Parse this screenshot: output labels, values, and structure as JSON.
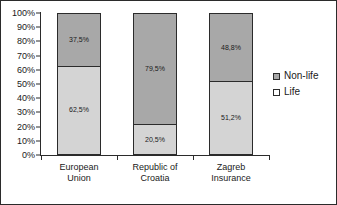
{
  "chart_data": {
    "type": "bar",
    "subtype": "100-percent-stacked-column",
    "title": "",
    "subtitle": "",
    "xlabel": "",
    "ylabel": "",
    "categories": [
      "European Union",
      "Republic of Croatia",
      "Zagreb Insurance"
    ],
    "category_lines": [
      [
        "European",
        "Union"
      ],
      [
        "Republic of",
        "Croatia"
      ],
      [
        "Zagreb",
        "Insurance"
      ]
    ],
    "series": [
      {
        "name": "Non-life",
        "color": "#a8a8a8",
        "values": [
          37.5,
          79.5,
          48.8
        ],
        "labels": [
          "37,5%",
          "79,5%",
          "48,8%"
        ]
      },
      {
        "name": "Life",
        "color": "#d4d4d4",
        "values": [
          62.5,
          20.5,
          51.2
        ],
        "labels": [
          "62,5%",
          "20,5%",
          "51,2%"
        ]
      }
    ],
    "ylim": [
      0,
      100
    ],
    "ytick_values": [
      0,
      10,
      20,
      30,
      40,
      50,
      60,
      70,
      80,
      90,
      100
    ],
    "ytick_labels": [
      "0%",
      "10%",
      "20%",
      "30%",
      "40%",
      "50%",
      "60%",
      "70%",
      "80%",
      "90%",
      "100%"
    ],
    "grid": false,
    "legend_position": "right",
    "stack_order": [
      "Life",
      "Non-life"
    ],
    "colors": {
      "nonlife": "#a8a8a8",
      "life": "#d4d4d4",
      "axis": "#2b2b2b",
      "text": "#1a1a1a",
      "background": "#ffffff"
    }
  },
  "legend": {
    "entries": [
      {
        "label": "Non-life"
      },
      {
        "label": "Life"
      }
    ]
  }
}
